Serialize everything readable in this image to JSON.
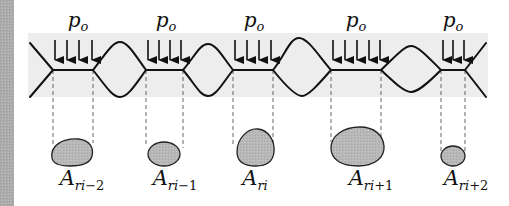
{
  "diagram": {
    "pressure_symbol": "p",
    "pressure_subscript": "o",
    "area_symbol": "A",
    "colors": {
      "left_strip": "#a9a9a9",
      "band": "#ececec",
      "line": "#111111",
      "blob_fill": "#b5b5b5",
      "dash": "#555555"
    },
    "contacts": [
      {
        "x1": 53,
        "x2": 93,
        "arrows": 4,
        "p_label": {
          "sym": "p",
          "sub": "o"
        },
        "area_label": {
          "sym": "A",
          "sub_var": "ri",
          "sub_suffix": "−2"
        },
        "blob": {
          "cx": 72,
          "cy": 152,
          "rx": 21,
          "ry": 13
        }
      },
      {
        "x1": 146,
        "x2": 183,
        "arrows": 4,
        "p_label": {
          "sym": "p",
          "sub": "o"
        },
        "area_label": {
          "sym": "A",
          "sub_var": "ri",
          "sub_suffix": "−1"
        },
        "blob": {
          "cx": 164,
          "cy": 153,
          "rx": 16,
          "ry": 12
        }
      },
      {
        "x1": 233,
        "x2": 273,
        "arrows": 4,
        "p_label": {
          "sym": "p",
          "sub": "o"
        },
        "area_label": {
          "sym": "A",
          "sub_var": "ri",
          "sub_suffix": ""
        },
        "blob": {
          "cx": 255,
          "cy": 147,
          "rx": 19,
          "ry": 19
        }
      },
      {
        "x1": 331,
        "x2": 381,
        "arrows": 5,
        "p_label": {
          "sym": "p",
          "sub": "o"
        },
        "area_label": {
          "sym": "A",
          "sub_var": "ri",
          "sub_suffix": "+1"
        },
        "blob": {
          "cx": 356,
          "cy": 146,
          "rx": 26,
          "ry": 19
        }
      },
      {
        "x1": 441,
        "x2": 465,
        "arrows": 3,
        "p_label": {
          "sym": "p",
          "sub": "o"
        },
        "area_label": {
          "sym": "A",
          "sub_var": "ri",
          "sub_suffix": "+2"
        },
        "blob": {
          "cx": 453,
          "cy": 156,
          "rx": 12,
          "ry": 10
        }
      }
    ],
    "labels": {
      "p": [
        "p",
        "p",
        "p",
        "p",
        "p"
      ],
      "p_sub": [
        "o",
        "o",
        "o",
        "o",
        "o"
      ],
      "a": [
        "A",
        "A",
        "A",
        "A",
        "A"
      ],
      "a_sub_var": [
        "ri",
        "ri",
        "ri",
        "ri",
        "ri"
      ],
      "a_sub_suffix": [
        "−2",
        "−1",
        "",
        "+1",
        "+2"
      ]
    }
  }
}
